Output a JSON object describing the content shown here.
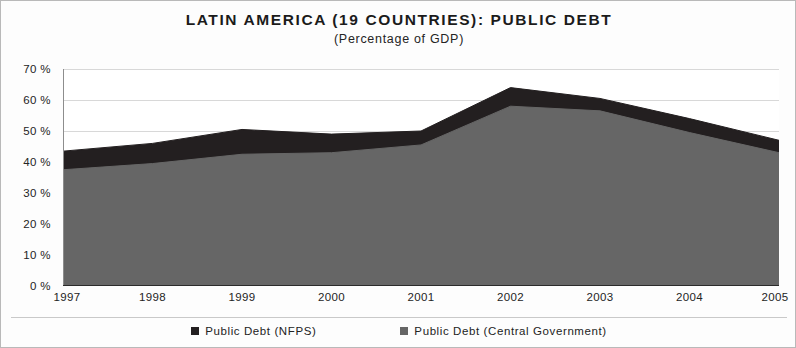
{
  "chart_data": {
    "type": "area",
    "title": "LATIN AMERICA (19 COUNTRIES): PUBLIC DEBT",
    "subtitle": "(Percentage of GDP)",
    "xlabel": "",
    "ylabel": "",
    "stacked": false,
    "grid": true,
    "legend_position": "bottom",
    "categories": [
      "1997",
      "1998",
      "1999",
      "2000",
      "2001",
      "2002",
      "2003",
      "2004",
      "2005"
    ],
    "x": [
      1997,
      1998,
      1999,
      2000,
      2001,
      2002,
      2003,
      2004,
      2005
    ],
    "ylim": [
      0,
      70
    ],
    "ytick_values": [
      0,
      10,
      20,
      30,
      40,
      50,
      60,
      70
    ],
    "ytick_labels": [
      "0 %",
      "10 %",
      "20 %",
      "30 %",
      "40 %",
      "50 %",
      "60 %",
      "70 %"
    ],
    "series": [
      {
        "name": "Public Debt (NFPS)",
        "color": "#231f20",
        "values": [
          43.5,
          46.0,
          50.5,
          49.0,
          50.0,
          64.0,
          60.5,
          54.0,
          47.0
        ]
      },
      {
        "name": "Public Debt (Central Government)",
        "color": "#666666",
        "values": [
          37.5,
          39.5,
          42.5,
          43.0,
          45.5,
          58.0,
          56.5,
          49.5,
          43.0
        ]
      }
    ]
  },
  "legend": {
    "items": [
      {
        "label": "Public Debt (NFPS)",
        "color": "#231f20",
        "icon": "square-marker-icon"
      },
      {
        "label": "Public Debt (Central Government)",
        "color": "#666666",
        "icon": "square-marker-icon"
      }
    ]
  },
  "colors": {
    "nfps": "#231f20",
    "central_government": "#666666",
    "gridline": "#d8d8d8",
    "axis": "#2b2b2b",
    "background": "#ffffff"
  }
}
